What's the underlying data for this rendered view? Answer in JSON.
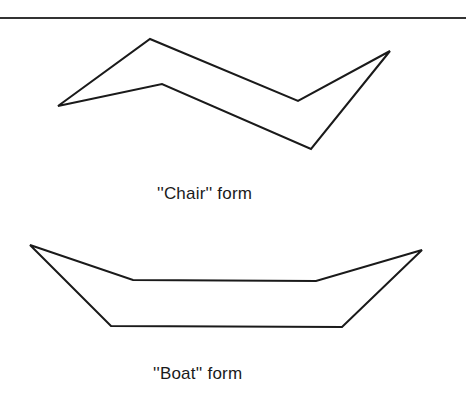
{
  "figure": {
    "chair": {
      "label": "''Chair'' form",
      "points": "58,106 150,39 298,101 390,51 311,149 162,84"
    },
    "boat": {
      "label": "''Boat'' form",
      "points": "30,245 133,280 316,281 422,250 342,327 111,326"
    },
    "stroke_color": "#1a1a1a"
  }
}
